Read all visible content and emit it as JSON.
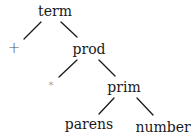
{
  "diagram": {
    "type": "parse-tree",
    "nodes": [
      {
        "id": "term",
        "label": "term",
        "x": 55,
        "y": 4
      },
      {
        "id": "plus",
        "label": "+",
        "x": 14,
        "y": 41
      },
      {
        "id": "prod",
        "label": "prod",
        "x": 89,
        "y": 42
      },
      {
        "id": "star",
        "label": "*",
        "x": 51,
        "y": 80
      },
      {
        "id": "prim",
        "label": "prim",
        "x": 124,
        "y": 80
      },
      {
        "id": "parens",
        "label": "parens",
        "x": 89,
        "y": 117
      },
      {
        "id": "number",
        "label": "number",
        "x": 163,
        "y": 120
      }
    ],
    "edges": [
      {
        "from": "term",
        "to": "plus",
        "x1": 41,
        "y1": 22,
        "x2": 24,
        "y2": 39
      },
      {
        "from": "term",
        "to": "prod",
        "x1": 61,
        "y1": 22,
        "x2": 77,
        "y2": 37
      },
      {
        "from": "prod",
        "to": "star",
        "x1": 77,
        "y1": 60,
        "x2": 59,
        "y2": 77
      },
      {
        "from": "prod",
        "to": "prim",
        "x1": 99,
        "y1": 60,
        "x2": 115,
        "y2": 76
      },
      {
        "from": "prim",
        "to": "parens",
        "x1": 114,
        "y1": 98,
        "x2": 99,
        "y2": 114
      },
      {
        "from": "prim",
        "to": "number",
        "x1": 137,
        "y1": 98,
        "x2": 153,
        "y2": 115
      }
    ],
    "colors": {
      "ink": "#1a1a1a",
      "background": "#ffffff"
    }
  }
}
